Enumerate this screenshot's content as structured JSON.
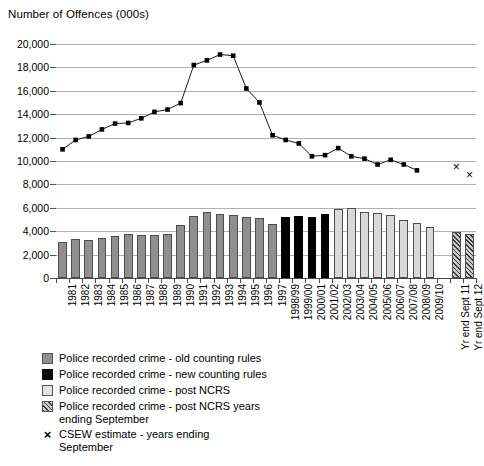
{
  "chart_data": {
    "type": "bar",
    "title": "Number of Offences (000s)",
    "xlabel": "",
    "ylabel": "Number of Offences (000s)",
    "ylim": [
      0,
      20000
    ],
    "ytick_step": 2000,
    "ytick_labels": [
      "20,000",
      "18,000",
      "16,000",
      "14,000",
      "12,000",
      "10,000",
      "8,000",
      "6,000",
      "4,000",
      "2,000",
      "0"
    ],
    "ytick_values": [
      20000,
      18000,
      16000,
      14000,
      12000,
      10000,
      8000,
      6000,
      4000,
      2000,
      0
    ],
    "grid": true,
    "legend_position": "below",
    "categories": [
      "1981",
      "1982",
      "1983",
      "1984",
      "1985",
      "1986",
      "1987",
      "1988",
      "1989",
      "1990",
      "1991",
      "1992",
      "1993",
      "1994",
      "1995",
      "1996",
      "1997",
      "1998/99",
      "1999/00",
      "2000/01",
      "2001/02",
      "2002/03",
      "2003/04",
      "2004/05",
      "2005/06",
      "2006/07",
      "2007/08",
      "2008/09",
      "2009/10",
      "",
      "Yr end Sept 11",
      "Yr end Sept 12"
    ],
    "series": [
      {
        "name": "Police recorded crime - old counting rules",
        "type": "bar",
        "style": "old",
        "color": "#8f8f8f",
        "values": [
          3100,
          3300,
          3250,
          3450,
          3550,
          3750,
          3700,
          3650,
          3800,
          4500,
          5300,
          5600,
          5500,
          5400,
          5200,
          5100,
          4600,
          null,
          null,
          null,
          null,
          null,
          null,
          null,
          null,
          null,
          null,
          null,
          null,
          null,
          null,
          null
        ]
      },
      {
        "name": "Police recorded crime - new counting rules",
        "type": "bar",
        "style": "new",
        "color": "#000000",
        "values": [
          null,
          null,
          null,
          null,
          null,
          null,
          null,
          null,
          null,
          null,
          null,
          null,
          null,
          null,
          null,
          null,
          null,
          5200,
          5300,
          5200,
          5500,
          null,
          null,
          null,
          null,
          null,
          null,
          null,
          null,
          null,
          null,
          null
        ]
      },
      {
        "name": "Police recorded crime - post NCRS",
        "type": "bar",
        "style": "postncrs",
        "color": "#d9d9d9",
        "values": [
          null,
          null,
          null,
          null,
          null,
          null,
          null,
          null,
          null,
          null,
          null,
          null,
          null,
          null,
          null,
          null,
          null,
          null,
          null,
          null,
          null,
          5900,
          5950,
          5650,
          5550,
          5400,
          5000,
          4700,
          4350,
          null,
          null,
          null
        ]
      },
      {
        "name": "Police recorded crime - post NCRS years ending September",
        "type": "bar",
        "style": "postncrs-sept",
        "color": "#8a8a8a",
        "values": [
          null,
          null,
          null,
          null,
          null,
          null,
          null,
          null,
          null,
          null,
          null,
          null,
          null,
          null,
          null,
          null,
          null,
          null,
          null,
          null,
          null,
          null,
          null,
          null,
          null,
          null,
          null,
          null,
          null,
          null,
          3900,
          3800
        ]
      },
      {
        "name": "CSEW estimate - line",
        "type": "line",
        "marker": "square",
        "color": "#000000",
        "values": [
          11000,
          11800,
          12100,
          12700,
          13200,
          13250,
          13650,
          14200,
          14400,
          14950,
          18200,
          18600,
          19100,
          19000,
          16200,
          15000,
          12200,
          11800,
          11500,
          10400,
          10500,
          11100,
          10400,
          10200,
          9700,
          10100,
          9700,
          9200,
          null,
          null,
          null,
          null
        ]
      },
      {
        "name": "CSEW estimate - years ending September",
        "type": "scatter",
        "marker": "x",
        "color": "#000000",
        "values": [
          null,
          null,
          null,
          null,
          null,
          null,
          null,
          null,
          null,
          null,
          null,
          null,
          null,
          null,
          null,
          null,
          null,
          null,
          null,
          null,
          null,
          null,
          null,
          null,
          null,
          null,
          null,
          null,
          null,
          null,
          9500,
          8800
        ]
      }
    ],
    "legend": [
      {
        "label": "Police recorded crime - old counting rules",
        "swatch": "old"
      },
      {
        "label": "Police recorded crime - new counting rules",
        "swatch": "new"
      },
      {
        "label": "Police recorded crime - post NCRS",
        "swatch": "postncrs"
      },
      {
        "label": "Police recorded crime - post NCRS years\nending September",
        "swatch": "postncrs-sept"
      },
      {
        "label": "CSEW estimate - years ending\nSeptember",
        "swatch": "x-marker",
        "glyph": "×"
      }
    ]
  }
}
